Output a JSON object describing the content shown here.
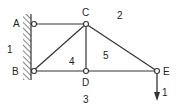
{
  "diagram": {
    "type": "truss",
    "nodes": [
      {
        "id": "A",
        "x": 33,
        "y": 24,
        "label": "A",
        "lx": 13,
        "ly": 27
      },
      {
        "id": "B",
        "x": 33,
        "y": 71,
        "label": "B",
        "lx": 12,
        "ly": 75
      },
      {
        "id": "C",
        "x": 86,
        "y": 24,
        "label": "C",
        "lx": 82,
        "ly": 16
      },
      {
        "id": "D",
        "x": 86,
        "y": 71,
        "label": "D",
        "lx": 82,
        "ly": 85
      },
      {
        "id": "E",
        "x": 157,
        "y": 71,
        "label": "E",
        "lx": 163,
        "ly": 75
      }
    ],
    "members": [
      [
        "A",
        "C"
      ],
      [
        "B",
        "D"
      ],
      [
        "D",
        "E"
      ],
      [
        "C",
        "D"
      ],
      [
        "B",
        "C"
      ],
      [
        "C",
        "E"
      ]
    ],
    "regions": [
      {
        "label": "1",
        "x": 8,
        "y": 53
      },
      {
        "label": "2",
        "x": 117,
        "y": 18
      },
      {
        "label": "3",
        "x": 83,
        "y": 102
      },
      {
        "label": "4",
        "x": 69,
        "y": 65
      },
      {
        "label": "5",
        "x": 103,
        "y": 58
      }
    ],
    "load": {
      "node": "E",
      "label": "1",
      "direction": "down"
    },
    "support": {
      "type": "fixed-wall",
      "side": "left"
    }
  },
  "text": {
    "A": "A",
    "B": "B",
    "C": "C",
    "D": "D",
    "E": "E",
    "r1": "1",
    "r2": "2",
    "r3": "3",
    "r4": "4",
    "r5": "5",
    "load": "1"
  }
}
